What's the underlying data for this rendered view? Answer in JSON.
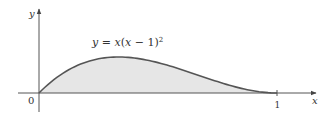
{
  "chart_data": {
    "type": "area",
    "title": "",
    "function_label": "y = x(x − 1)²",
    "function_label_parts": {
      "lhs": "y",
      "eq": " = ",
      "x": "x",
      "open": "(",
      "x2": "x",
      "minus": " − 1)",
      "exp": "2"
    },
    "xlabel": "x",
    "ylabel": "y",
    "origin_label": "0",
    "x_ticks": [
      {
        "value": 1,
        "label": "1"
      }
    ],
    "xlim": [
      0,
      1
    ],
    "ylim": [
      0,
      0.148
    ],
    "shaded_region": "area under curve between x=0 and x=1",
    "x": [
      0,
      0.1,
      0.2,
      0.3333,
      0.5,
      0.6,
      0.7,
      0.8,
      0.9,
      1.0
    ],
    "values": [
      0,
      0.081,
      0.128,
      0.148,
      0.125,
      0.096,
      0.063,
      0.032,
      0.009,
      0
    ],
    "grid": false,
    "colors": {
      "curve": "#555555",
      "fill": "#e6e6e6",
      "axis": "#555555"
    }
  }
}
